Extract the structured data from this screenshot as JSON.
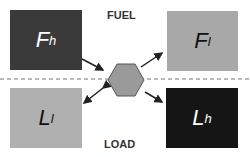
{
  "labels": {
    "top": "FUEL",
    "bottom": "LOAD"
  },
  "boxes": {
    "fh": {
      "main": "F",
      "sub": "h",
      "color": "#3a3a3a",
      "text": "#ffffff"
    },
    "fl": {
      "main": "F",
      "sub": "l",
      "color": "#a8a8a8",
      "text": "#111111"
    },
    "ll": {
      "main": "L",
      "sub": "l",
      "color": "#b0b0b0",
      "text": "#111111"
    },
    "lh": {
      "main": "L",
      "sub": "h",
      "color": "#151515",
      "text": "#ffffff"
    }
  },
  "hexagon": {
    "color": "#9a9a9a"
  }
}
